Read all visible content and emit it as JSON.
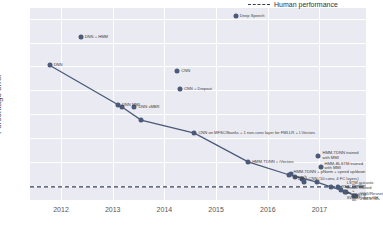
{
  "chart_data": {
    "type": "line",
    "title": "",
    "xlabel": "",
    "ylabel": "Percentage error",
    "xlim": [
      2011.4,
      2017.9
    ],
    "ylim": [
      4.8,
      20.9
    ],
    "grid": true,
    "legend_position": "top-right",
    "xticks": [
      "2012",
      "2013",
      "2014",
      "2015",
      "2016",
      "2017"
    ],
    "xtick_values": [
      2012,
      2013,
      2014,
      2015,
      2016,
      2017
    ],
    "yticks": [
      "6",
      "8",
      "10",
      "12",
      "14",
      "16",
      "18",
      "20"
    ],
    "ytick_values": [
      6,
      8,
      10,
      12,
      14,
      16,
      18,
      20
    ],
    "legend": [
      {
        "name": "Human performance",
        "style": "dashed",
        "color": "#35415c"
      }
    ],
    "human_performance": {
      "label": "Human performance",
      "value": 5.9
    },
    "series": [
      {
        "name": "State of the art",
        "color": "#4a5a78",
        "points": [
          {
            "x": 2011.78,
            "y": 16.1,
            "label": "DNN"
          },
          {
            "x": 2013.18,
            "y": 12.6,
            "label": "DNN-HMM"
          },
          {
            "x": 2013.55,
            "y": 11.5,
            "label": "DNN + sMBR"
          },
          {
            "x": 2014.58,
            "y": 10.4,
            "label": "CNN on MFSC/fbanks + 1 non-conv layer for FMLLR + I-Vectors"
          },
          {
            "x": 2015.62,
            "y": 8.0,
            "label": "HMM-TDNN + iVectors"
          },
          {
            "x": 2016.42,
            "y": 6.9,
            "label": "HMM-TDNN + pNorm + speed up/down speech"
          },
          {
            "x": 2016.95,
            "y": 6.3,
            "label": "Deep CNN (10 conv, 4 FC layers)"
          },
          {
            "x": 2017.22,
            "y": 5.9,
            "label": "RNN + VGG + LSTM acoustic model trained on SWB+Fisher+CH"
          },
          {
            "x": 2017.52,
            "y": 5.5,
            "label": "ResNet + BiLSTMs acoustic model"
          },
          {
            "x": 2017.7,
            "y": 5.1,
            "label": "VGG/Resnet + BiLSTMs"
          }
        ]
      }
    ],
    "scatter_points": [
      {
        "x": 2012.38,
        "y": 18.5,
        "label": "DNN + HMM"
      },
      {
        "x": 2015.38,
        "y": 20.2,
        "label": "Deep Speech"
      },
      {
        "x": 2014.25,
        "y": 15.6,
        "label": "CNN"
      },
      {
        "x": 2014.3,
        "y": 14.1,
        "label": "CNN + Dropout"
      },
      {
        "x": 2013.1,
        "y": 12.8,
        "label": "DNN MMI"
      },
      {
        "x": 2013.42,
        "y": 12.6,
        "label": "DNN sMBR"
      },
      {
        "x": 2016.44,
        "y": 7.0,
        "label": "HMM-TDNN + pNorm + speed up/down speech"
      },
      {
        "x": 2016.52,
        "y": 6.75,
        "label": "Deep CNN (10 conv, 4 FC layers)"
      },
      {
        "x": 2016.66,
        "y": 6.55,
        "label": "Deep CNN (10 conv, 4 FC layers)"
      },
      {
        "x": 2016.7,
        "y": 6.3,
        "label": "Deep CNN (10 conv, 4 FC layers)"
      },
      {
        "x": 2016.98,
        "y": 8.5,
        "label": "HMM-TDNN trained with MMI"
      },
      {
        "x": 2017.02,
        "y": 7.6,
        "label": "HMM-BLSTM trained with MMI"
      },
      {
        "x": 2017.35,
        "y": 5.85,
        "label": "RNN + VGG"
      },
      {
        "x": 2017.42,
        "y": 5.65,
        "label": "LSTM acoustic"
      },
      {
        "x": 2017.5,
        "y": 5.45,
        "label": "ResNet + BiLSTM ac."
      },
      {
        "x": 2017.66,
        "y": 5.12,
        "label": "VGG/Resnet + BiLSTMs"
      }
    ],
    "annotations": [
      {
        "x": 2012.38,
        "y": 18.5,
        "text": "DNN + HMM"
      },
      {
        "x": 2015.38,
        "y": 20.2,
        "text": "Deep Speech"
      },
      {
        "x": 2011.78,
        "y": 16.1,
        "text": "DNN"
      },
      {
        "x": 2014.25,
        "y": 15.6,
        "text": "CNN"
      },
      {
        "x": 2014.3,
        "y": 14.1,
        "text": "CNN + Dropout"
      },
      {
        "x": 2013.1,
        "y": 12.8,
        "text": "DNN MMI"
      },
      {
        "x": 2013.42,
        "y": 12.6,
        "text": "DNN sMBR"
      },
      {
        "x": 2014.58,
        "y": 10.4,
        "text": "CNN on MFSC/fbanks + 1 non-conv layer for FMLLR + I-Vectors"
      },
      {
        "x": 2016.42,
        "y": 6.9,
        "text": "HMM-TDNN + pNorm + speed up/down speech"
      },
      {
        "x": 2016.5,
        "y": 6.6,
        "text": "Deep CNN (10 conv, 4 FC layers)"
      },
      {
        "x": 2015.62,
        "y": 8.0,
        "text": "HMM-TDNN + iVectors"
      },
      {
        "x": 2016.98,
        "y": 8.5,
        "text": "HMM-TDNN trained with MMI"
      },
      {
        "x": 2017.02,
        "y": 7.6,
        "text": "HMM-BLSTM trained with MMI"
      },
      {
        "x": 2017.35,
        "y": 5.85,
        "text": "RNN + VGG"
      },
      {
        "x": 2017.45,
        "y": 5.6,
        "text": "LSTM acoustic model trained on SWB+Fisher+CH"
      },
      {
        "x": 2017.55,
        "y": 5.4,
        "text": "ResNet + BiLSTM ac."
      },
      {
        "x": 2017.7,
        "y": 5.05,
        "text": "VGG/Resnet + BiLSTMs"
      }
    ]
  }
}
